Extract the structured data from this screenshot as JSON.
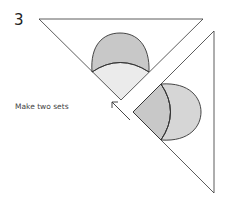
{
  "step": {
    "number": "3"
  },
  "instruction": {
    "text": "Make two sets"
  },
  "colors": {
    "outline": "#333333",
    "dark_fill": "#c8c8c8",
    "light_fill": "#ebebeb",
    "background": "#ffffff"
  },
  "figures": [
    {
      "name": "top-triangle-piece",
      "description": "Triangle with two-tone semicircle appliqué at apex"
    },
    {
      "name": "right-triangle-piece",
      "description": "Triangle with overlapping two-tone semicircle appliqué at left apex"
    }
  ],
  "arrow": {
    "direction": "up-left"
  }
}
